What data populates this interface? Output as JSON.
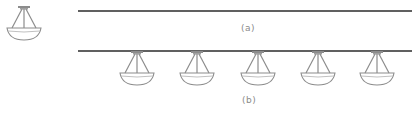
{
  "diagram": {
    "standalone_fixture": {
      "x": 24,
      "label": "pendant-light"
    },
    "panel_a": {
      "caption": "(a)",
      "line": {
        "x1": 78,
        "x2": 412,
        "y": 11
      }
    },
    "panel_b": {
      "caption": "(b)",
      "line": {
        "x1": 78,
        "x2": 412,
        "y": 51
      },
      "fixtures_x": [
        137,
        197,
        258,
        318,
        377
      ]
    },
    "colors": {
      "line": "#2b2b2b",
      "fixture": "#8c8c8c",
      "caption": "#8a8a8a"
    }
  }
}
